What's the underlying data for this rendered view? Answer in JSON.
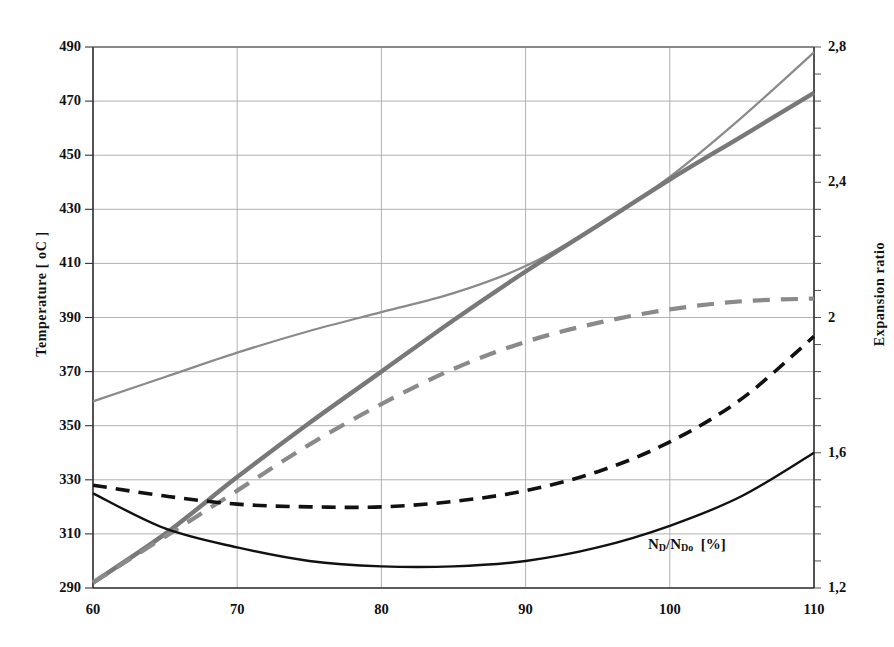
{
  "chart_data": {
    "type": "line",
    "title": "",
    "subtitle": "",
    "xlabel": "N_D/N_Do [%]",
    "ylabel": "Temperature [ oC ]",
    "y2label": "Expansion ratio",
    "xlim": [
      60,
      110
    ],
    "ylim": [
      290,
      490
    ],
    "y2lim": [
      1.2,
      2.8
    ],
    "grid": true,
    "legend": "none",
    "x_ticks": [
      "60",
      "70",
      "80",
      "90",
      "100",
      "110"
    ],
    "x_tick_values": [
      60,
      70,
      80,
      90,
      100,
      110
    ],
    "y_ticks": [
      "290",
      "310",
      "330",
      "350",
      "370",
      "390",
      "410",
      "430",
      "450",
      "470",
      "490"
    ],
    "y_tick_values": [
      290,
      310,
      330,
      350,
      370,
      390,
      410,
      430,
      450,
      470,
      490
    ],
    "y2_ticks": [
      "1,2",
      "1,6",
      "2",
      "2,4",
      "2,8"
    ],
    "y2_tick_values": [
      1.2,
      1.6,
      2.0,
      2.4,
      2.8
    ],
    "x": [
      60,
      65,
      70,
      75,
      80,
      85,
      90,
      95,
      100,
      105,
      110
    ],
    "series": [
      {
        "name": "temperature-thin-gray-solid",
        "axis": "left",
        "style": "solid",
        "color": "#8a8a8a",
        "width": 2.2,
        "values": [
          359,
          368,
          377,
          385,
          392,
          399,
          409,
          424,
          442,
          464,
          488
        ]
      },
      {
        "name": "temperature-thick-gray-solid",
        "axis": "left",
        "style": "solid",
        "color": "#787878",
        "width": 4.4,
        "values": [
          292,
          310,
          331,
          351,
          370,
          389,
          407,
          424,
          441,
          457,
          473
        ]
      },
      {
        "name": "expansion-ratio-gray-dashed",
        "axis": "right",
        "style": "dashed",
        "color": "#8a8a8a",
        "width": 4.2,
        "values": [
          292,
          309,
          326,
          343,
          358,
          371,
          381,
          388,
          393,
          396,
          397
        ]
      },
      {
        "name": "temperature-black-dashed",
        "axis": "left",
        "style": "dashed",
        "color": "#111111",
        "width": 3.6,
        "values": [
          328,
          324,
          321,
          320,
          320,
          322,
          326,
          333,
          344,
          360,
          383
        ]
      },
      {
        "name": "expansion-ratio-black-solid",
        "axis": "right",
        "style": "solid",
        "color": "#111111",
        "width": 2.4,
        "values": [
          325,
          312,
          305,
          300,
          298,
          298,
          300,
          305,
          313,
          324,
          340
        ]
      }
    ],
    "annotations": [
      {
        "text": "N_D/N_Do [%]",
        "x": 98,
        "y": 304
      }
    ]
  },
  "axes": {
    "left_title": "Temperature [ oC ]",
    "right_title": "Expansion ratio",
    "x_labels": [
      "60",
      "70",
      "80",
      "90",
      "100",
      "110"
    ],
    "y_left_labels": [
      "490",
      "470",
      "450",
      "430",
      "410",
      "390",
      "370",
      "350",
      "330",
      "310",
      "290"
    ],
    "y_right_labels": [
      "2,8",
      "2,4",
      "2",
      "1,6",
      "1,2"
    ]
  },
  "annotation": {
    "prefix": "N",
    "sub1": "D",
    "slash": "/N",
    "sub2": "Do",
    "unit": "[%]"
  }
}
